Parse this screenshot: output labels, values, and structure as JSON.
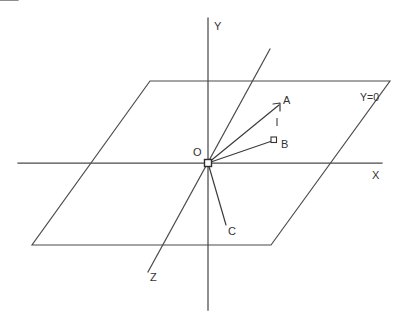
{
  "diagram": {
    "canvas": {
      "width": 402,
      "height": 317,
      "background": "#ffffff"
    },
    "colors": {
      "stroke": "#4a4a4a",
      "vector": "#3c3c3c",
      "text": "#333333",
      "marker_fill": "#ffffff"
    },
    "labels": {
      "y_axis": "Y",
      "x_axis": "X",
      "z_axis": "Z",
      "origin": "O",
      "plane": "Y=0",
      "point_a": "A",
      "point_b": "B",
      "point_c": "C"
    },
    "geometry": {
      "origin": {
        "x": 208,
        "y": 163
      },
      "y_axis": {
        "x1": 208,
        "y1": 18,
        "x2": 208,
        "y2": 310
      },
      "x_axis": {
        "x1": 18,
        "y1": 163,
        "x2": 382,
        "y2": 163
      },
      "z_axis": {
        "x1": 270,
        "y1": 49,
        "x2": 148,
        "y2": 272
      },
      "plane_points": "150,81 390,81 271,245 32,245",
      "vector_oa": {
        "x1": 208,
        "y1": 163,
        "x2": 280,
        "y2": 104
      },
      "vector_ob": {
        "x1": 208,
        "y1": 163,
        "x2": 274,
        "y2": 141
      },
      "vector_oc": {
        "x1": 208,
        "y1": 163,
        "x2": 226,
        "y2": 225
      },
      "tick_between_ab": {
        "x1": 277,
        "y1": 118,
        "x2": 277,
        "y2": 126
      }
    },
    "label_positions": {
      "y_axis": {
        "left": 214,
        "top": 21
      },
      "x_axis": {
        "left": 372,
        "top": 170
      },
      "z_axis": {
        "left": 150,
        "top": 272
      },
      "origin": {
        "left": 193,
        "top": 147
      },
      "plane": {
        "left": 360,
        "top": 92
      },
      "point_a": {
        "left": 283,
        "top": 95
      },
      "point_b": {
        "left": 281,
        "top": 139
      },
      "point_c": {
        "left": 228,
        "top": 226
      }
    }
  }
}
